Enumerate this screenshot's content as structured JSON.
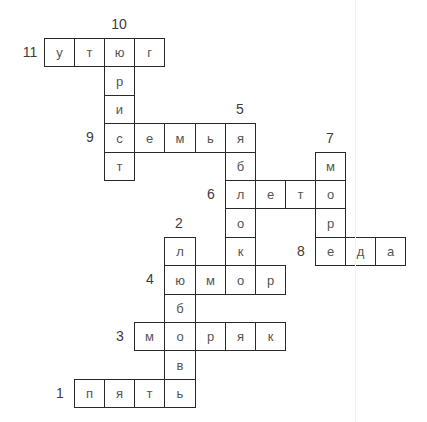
{
  "puzzle": {
    "type": "crossword",
    "grid": {
      "origin_x": 44,
      "origin_y": 38,
      "cell_w": 30.1,
      "cell_h": 28.4,
      "cols": 12,
      "rows": 13
    },
    "words": [
      {
        "number": "1",
        "direction": "across",
        "row": 12,
        "col": 1,
        "letters": [
          "п",
          "я",
          "т",
          "ь"
        ]
      },
      {
        "number": "2",
        "direction": "down",
        "row": 7,
        "col": 4,
        "letters": [
          "л",
          "ю",
          "б",
          "о",
          "в",
          "ь"
        ]
      },
      {
        "number": "3",
        "direction": "across",
        "row": 10,
        "col": 3,
        "letters": [
          "м",
          "о",
          "р",
          "я",
          "к"
        ]
      },
      {
        "number": "4",
        "direction": "across",
        "row": 8,
        "col": 4,
        "letters": [
          "ю",
          "м",
          "о",
          "р"
        ]
      },
      {
        "number": "5",
        "direction": "down",
        "row": 3,
        "col": 6,
        "letters": [
          "я",
          "б",
          "л",
          "о",
          "к",
          "о"
        ]
      },
      {
        "number": "6",
        "direction": "across",
        "row": 5,
        "col": 6,
        "letters": [
          "л",
          "е",
          "т",
          "о"
        ]
      },
      {
        "number": "7",
        "direction": "down",
        "row": 4,
        "col": 9,
        "letters": [
          "м",
          "о",
          "р",
          "е"
        ]
      },
      {
        "number": "8",
        "direction": "across",
        "row": 7,
        "col": 9,
        "letters": [
          "е",
          "д",
          "а"
        ]
      },
      {
        "number": "9",
        "direction": "across",
        "row": 3,
        "col": 2,
        "letters": [
          "с",
          "е",
          "м",
          "ь",
          "я"
        ]
      },
      {
        "number": "10",
        "direction": "down",
        "row": 0,
        "col": 2,
        "letters": [
          "ю",
          "р",
          "и",
          "с",
          "т"
        ]
      },
      {
        "number": "11",
        "direction": "across",
        "row": 0,
        "col": 0,
        "letters": [
          "у",
          "т",
          "ю",
          "г"
        ]
      }
    ]
  },
  "colors": {
    "border": "#2a2a2a",
    "letter": "#555555",
    "number": "#3c3c3c",
    "background": "#ffffff"
  }
}
